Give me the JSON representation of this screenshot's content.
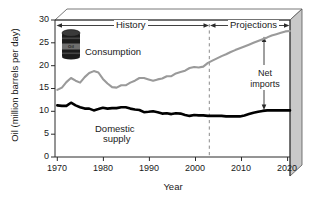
{
  "chart_data": {
    "type": "line",
    "title": "",
    "xlabel": "Year",
    "ylabel": "Oil (million barrels per day)",
    "xlim": [
      1970,
      2021
    ],
    "ylim": [
      0,
      30
    ],
    "xticks": [
      "1970",
      "1980",
      "1990",
      "2000",
      "2010",
      "2020"
    ],
    "yticks": [
      "0",
      "5",
      "10",
      "15",
      "20",
      "25",
      "30"
    ],
    "grid": false,
    "legend_position": "inline-annotations",
    "x": [
      1970,
      1971,
      1972,
      1973,
      1974,
      1975,
      1976,
      1977,
      1978,
      1979,
      1980,
      1981,
      1982,
      1983,
      1984,
      1985,
      1986,
      1987,
      1988,
      1989,
      1990,
      1991,
      1992,
      1993,
      1994,
      1995,
      1996,
      1997,
      1998,
      1999,
      2000,
      2001,
      2002,
      2003,
      2004,
      2005,
      2006,
      2007,
      2008,
      2009,
      2010,
      2011,
      2012,
      2013,
      2014,
      2015,
      2016,
      2017,
      2018,
      2019,
      2020,
      2021
    ],
    "series": [
      {
        "name": "Consumption",
        "color": "#9a9a9a",
        "values": [
          14.7,
          15.2,
          16.4,
          17.3,
          16.7,
          16.3,
          17.5,
          18.4,
          18.8,
          18.5,
          17.1,
          16.1,
          15.3,
          15.2,
          15.7,
          15.7,
          16.3,
          16.7,
          17.3,
          17.3,
          17.0,
          16.7,
          17.0,
          17.2,
          17.7,
          17.7,
          18.3,
          18.6,
          18.9,
          19.5,
          19.7,
          19.6,
          19.8,
          20.6,
          21.1,
          21.6,
          22.1,
          22.5,
          23.0,
          23.4,
          23.8,
          24.2,
          24.6,
          25.0,
          25.4,
          25.8,
          26.2,
          26.6,
          26.9,
          27.2,
          27.5,
          27.6
        ]
      },
      {
        "name": "Domestic supply",
        "color": "#000000",
        "values": [
          11.3,
          11.2,
          11.2,
          11.9,
          11.3,
          10.9,
          10.6,
          10.6,
          10.2,
          10.5,
          10.8,
          10.6,
          10.7,
          10.7,
          10.9,
          10.9,
          10.6,
          10.4,
          10.3,
          9.8,
          9.9,
          10.0,
          9.8,
          9.5,
          9.6,
          9.4,
          9.6,
          9.5,
          9.2,
          9.0,
          9.2,
          9.1,
          9.1,
          9.0,
          9.0,
          9.0,
          9.0,
          8.9,
          8.9,
          8.9,
          8.9,
          9.1,
          9.4,
          9.7,
          9.9,
          10.1,
          10.2,
          10.2,
          10.2,
          10.2,
          10.2,
          10.2
        ]
      }
    ],
    "annotations": [
      {
        "name": "history",
        "label": "History",
        "from_year": 1970,
        "to_year": 2003
      },
      {
        "name": "projections",
        "label": "Projections",
        "from_year": 2003,
        "to_year": 2021
      },
      {
        "name": "net-imports",
        "label": "Net\nimports",
        "at_year": 2015,
        "from_value": 10.2,
        "to_value": 26.0
      },
      {
        "name": "divider",
        "label": "",
        "at_year": 2003
      }
    ]
  },
  "labels": {
    "y_axis_title": "Oil (million barrels per day)",
    "x_axis_title": "Year",
    "consumption": "Consumption",
    "domestic_supply_line1": "Domestic",
    "domestic_supply_line2": "supply",
    "history": "History",
    "projections": "Projections",
    "net_imports_line1": "Net",
    "net_imports_line2": "imports",
    "barrel_text": "Oil"
  },
  "yticks": {
    "t0": "0",
    "t5": "5",
    "t10": "10",
    "t15": "15",
    "t20": "20",
    "t25": "25",
    "t30": "30"
  },
  "xticks": {
    "t1970": "1970",
    "t1980": "1980",
    "t1990": "1990",
    "t2000": "2000",
    "t2010": "2010",
    "t2020": "2020"
  },
  "colors": {
    "consumption": "#9a9a9a",
    "domestic": "#000000",
    "box_side": "#c9c9c9",
    "axis": "#2b2b2b"
  }
}
